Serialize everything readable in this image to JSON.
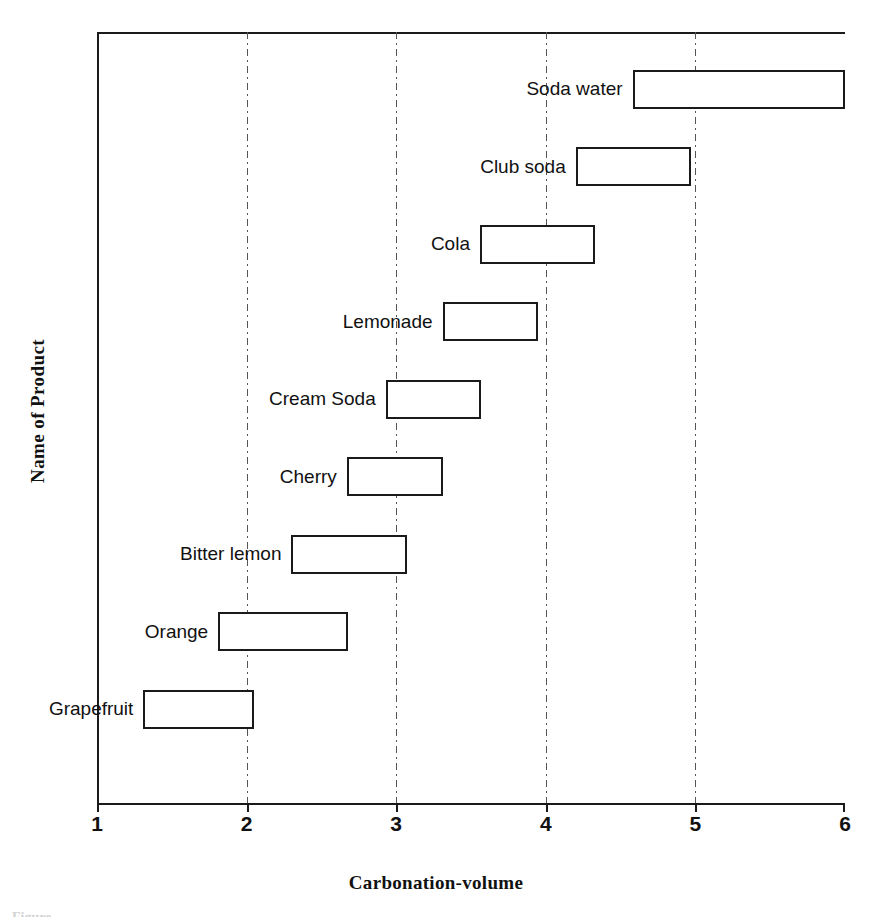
{
  "chart_data": {
    "type": "bar",
    "title": "",
    "xlabel": "Carbonation-volume",
    "ylabel": "Name of Product",
    "xlim": [
      1,
      6
    ],
    "xticks": [
      1,
      2,
      3,
      4,
      5,
      6
    ],
    "xtick_labels": [
      "1",
      "2",
      "3",
      "4",
      "5",
      "6"
    ],
    "grid": "vertical dash-dot gridlines at 2, 3, 4, 5",
    "legend": "none",
    "orientation": "horizontal",
    "note": "Floating range bars: each product spans a minimum and maximum carbonation volume.",
    "categories": [
      "Soda water",
      "Club soda",
      "Cola",
      "Lemonade",
      "Cream Soda",
      "Cherry",
      "Bitter lemon",
      "Orange",
      "Grapefruit"
    ],
    "ranges": [
      {
        "label": "Soda water",
        "low": 4.58,
        "high": 6.0
      },
      {
        "label": "Club soda",
        "low": 4.2,
        "high": 4.97
      },
      {
        "label": "Cola",
        "low": 3.56,
        "high": 4.33
      },
      {
        "label": "Lemonade",
        "low": 3.31,
        "high": 3.95
      },
      {
        "label": "Cream Soda",
        "low": 2.93,
        "high": 3.57
      },
      {
        "label": "Cherry",
        "low": 2.67,
        "high": 3.31
      },
      {
        "label": "Bitter lemon",
        "low": 2.3,
        "high": 3.07
      },
      {
        "label": "Orange",
        "low": 1.81,
        "high": 2.68
      },
      {
        "label": "Grapefruit",
        "low": 1.31,
        "high": 2.05
      }
    ],
    "series": [
      {
        "name": "minimum carbonation",
        "values": [
          4.58,
          4.2,
          3.56,
          3.31,
          2.93,
          2.67,
          2.3,
          1.81,
          1.31
        ]
      },
      {
        "name": "maximum carbonation",
        "values": [
          6.0,
          4.97,
          4.33,
          3.95,
          3.57,
          3.31,
          3.07,
          2.68,
          2.05
        ]
      }
    ],
    "colors": {
      "box_fill": "#ffffff",
      "box_stroke": "#1a1a1a",
      "axis": "#1a1a1a",
      "gridline": "#555555",
      "text": "#111111",
      "background": "#ffffff"
    }
  },
  "caption": {
    "clipped_text": "Figure"
  }
}
